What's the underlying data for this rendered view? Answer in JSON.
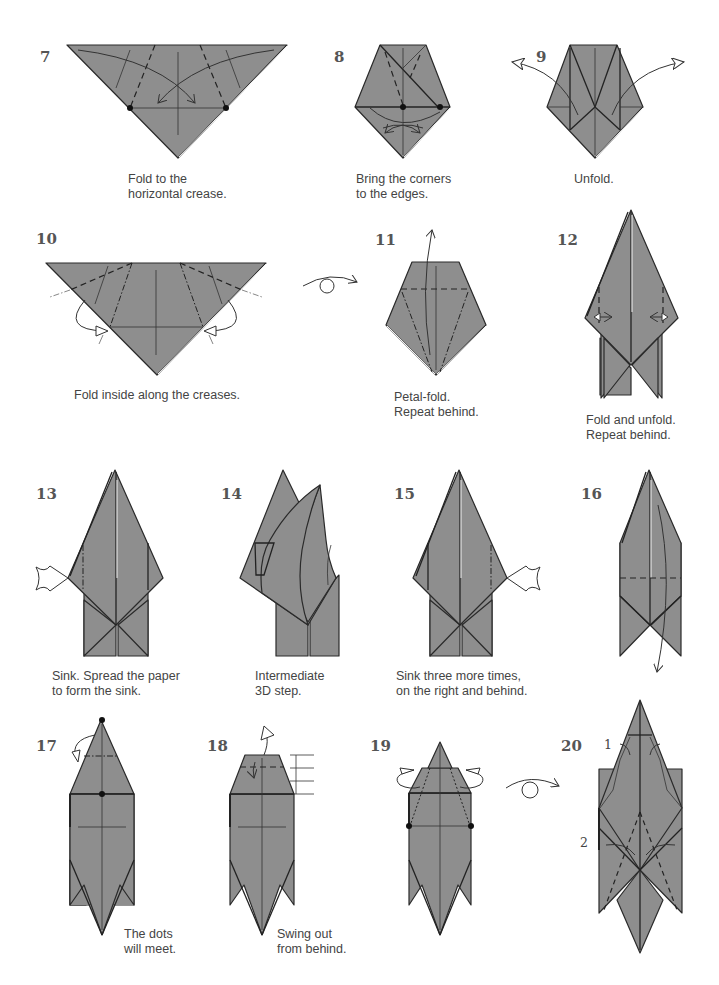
{
  "diagram": {
    "paper_color": "#8e8e8e",
    "line_color": "#2a2a2a",
    "steps": [
      {
        "number": "7",
        "caption": "Fold to the\nhorizontal crease."
      },
      {
        "number": "8",
        "caption": "Bring the corners\nto the edges."
      },
      {
        "number": "9",
        "caption": "Unfold."
      },
      {
        "number": "10",
        "caption": "Fold inside along the creases."
      },
      {
        "number": "11",
        "caption": "Petal-fold.\nRepeat behind."
      },
      {
        "number": "12",
        "caption": "Fold and unfold.\nRepeat behind."
      },
      {
        "number": "13",
        "caption": "Sink. Spread the paper\nto form the sink."
      },
      {
        "number": "14",
        "caption": "Intermediate\n3D step."
      },
      {
        "number": "15",
        "caption": "Sink three more times,\non the right and behind."
      },
      {
        "number": "16",
        "caption": ""
      },
      {
        "number": "17",
        "caption": "The dots\nwill meet."
      },
      {
        "number": "18",
        "caption": "Swing out\nfrom behind."
      },
      {
        "number": "19",
        "caption": ""
      },
      {
        "number": "20",
        "caption": ""
      }
    ],
    "step20_labels": [
      "1",
      "2"
    ],
    "symbols": [
      "valley-fold-line",
      "mountain-fold-line",
      "fold-arrow",
      "push-sink-arrow",
      "turn-over-symbol",
      "dot-marker",
      "equal-division-marks"
    ]
  }
}
